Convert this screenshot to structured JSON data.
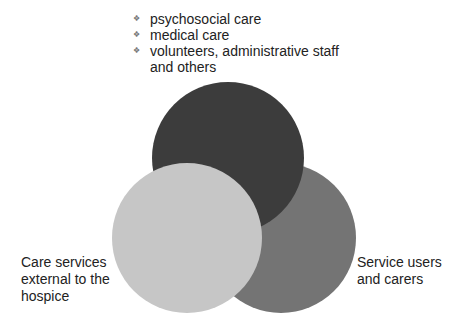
{
  "bullets": {
    "items": [
      {
        "text": "psychosocial care"
      },
      {
        "text": "medical care"
      },
      {
        "text": "volunteers, administrative staff"
      },
      {
        "text": "and others",
        "continuation": true
      }
    ],
    "bullet_icon": "❖"
  },
  "circles": {
    "staff": {
      "color": "#3c3c3c"
    },
    "external": {
      "color": "#c6c6c6"
    },
    "users": {
      "color": "#747474"
    }
  },
  "labels": {
    "left": {
      "line1": "Care services",
      "line2": "external to the",
      "line3": "hospice"
    },
    "right": {
      "line1": "Service users",
      "line2": "and carers"
    }
  }
}
